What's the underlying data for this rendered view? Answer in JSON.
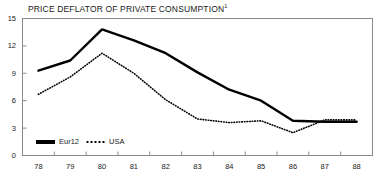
{
  "chart_data": {
    "type": "line",
    "title": "PRICE DEFLATOR OF PRIVATE CONSUMPTION",
    "title_footnote": "1",
    "xlabel": "",
    "ylabel": "",
    "categories": [
      "78",
      "79",
      "80",
      "81",
      "82",
      "83",
      "84",
      "85",
      "86",
      "87",
      "88"
    ],
    "x": [
      78,
      79,
      80,
      81,
      82,
      83,
      84,
      85,
      86,
      87,
      88
    ],
    "xlim": [
      77.5,
      88.5
    ],
    "ylim": [
      0,
      15
    ],
    "yticks": [
      0,
      3,
      6,
      9,
      12,
      15
    ],
    "xticks": [
      "78",
      "79",
      "80",
      "81",
      "82",
      "83",
      "84",
      "85",
      "86",
      "87",
      "88"
    ],
    "grid": false,
    "legend_position": "bottom-left",
    "series": [
      {
        "name": "Eur12",
        "style": "solid",
        "color": "#000000",
        "values": [
          9.3,
          10.4,
          13.8,
          12.6,
          11.2,
          9.1,
          7.2,
          6.0,
          3.8,
          3.7,
          3.7
        ]
      },
      {
        "name": "USA",
        "style": "dotted",
        "color": "#000000",
        "values": [
          6.7,
          8.6,
          11.2,
          9.0,
          6.1,
          4.0,
          3.6,
          3.8,
          2.5,
          3.9,
          3.9
        ]
      }
    ]
  },
  "axes": {
    "y_tick_labels": [
      "15",
      "12",
      "9",
      "6",
      "3",
      "0"
    ],
    "x_tick_labels": [
      "78",
      "79",
      "80",
      "81",
      "82",
      "83",
      "84",
      "85",
      "86",
      "87",
      "88"
    ]
  },
  "legend": {
    "items": [
      {
        "label": "Eur12",
        "swatch": "solid-line-swatch"
      },
      {
        "label": "USA",
        "swatch": "dotted-line-swatch"
      }
    ]
  }
}
